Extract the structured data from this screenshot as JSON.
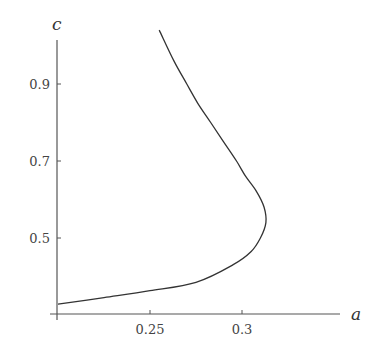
{
  "chart_data": {
    "type": "line",
    "title": "",
    "xlabel": "a",
    "ylabel": "c",
    "xlim": [
      0.2,
      0.37
    ],
    "ylim": [
      0.3,
      1.05
    ],
    "x_ticks": [
      0.25,
      0.3
    ],
    "x_tick_labels": [
      "0.25",
      "0.3"
    ],
    "y_ticks": [
      0.5,
      0.7,
      0.9
    ],
    "y_tick_labels": [
      "0.5",
      "0.7",
      "0.9"
    ],
    "grid": false,
    "legend": null,
    "series": [
      {
        "name": "curve",
        "color": "#333333",
        "points": [
          [
            0.2,
            0.328
          ],
          [
            0.225,
            0.345
          ],
          [
            0.25,
            0.363
          ],
          [
            0.275,
            0.385
          ],
          [
            0.295,
            0.43
          ],
          [
            0.305,
            0.465
          ],
          [
            0.31,
            0.5
          ],
          [
            0.313,
            0.54
          ],
          [
            0.312,
            0.58
          ],
          [
            0.308,
            0.62
          ],
          [
            0.302,
            0.66
          ],
          [
            0.297,
            0.7
          ],
          [
            0.29,
            0.75
          ],
          [
            0.283,
            0.8
          ],
          [
            0.276,
            0.85
          ],
          [
            0.27,
            0.9
          ],
          [
            0.263,
            0.96
          ],
          [
            0.255,
            1.04
          ]
        ]
      }
    ]
  },
  "axes": {
    "x_label": "a",
    "y_label": "c",
    "x_tick_labels": [
      "0.25",
      "0.3"
    ],
    "y_tick_labels": [
      "0.9",
      "0.7",
      "0.5"
    ]
  },
  "colors": {
    "axis": "#555555",
    "curve": "#333333",
    "text": "#444444"
  }
}
